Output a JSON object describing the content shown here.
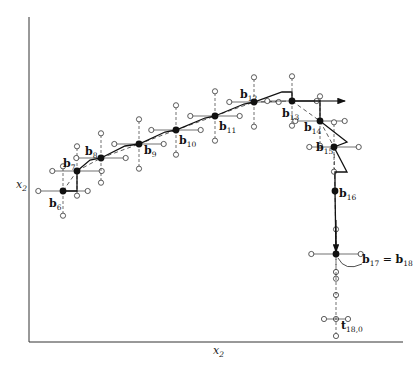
{
  "figure": {
    "axes": {
      "y_label": "x",
      "y_label_sub": "2",
      "x_label": "x",
      "x_label_sub": "2"
    },
    "points": [
      {
        "id": "b6",
        "base": "b",
        "sub": "6"
      },
      {
        "id": "b7",
        "base": "b",
        "sub": "7"
      },
      {
        "id": "b8",
        "base": "b",
        "sub": "8"
      },
      {
        "id": "b9",
        "base": "b",
        "sub": "9"
      },
      {
        "id": "b10",
        "base": "b",
        "sub": "10"
      },
      {
        "id": "b11",
        "base": "b",
        "sub": "11"
      },
      {
        "id": "b12",
        "base": "b",
        "sub": "12"
      },
      {
        "id": "b13",
        "base": "b",
        "sub": "13"
      },
      {
        "id": "b14",
        "base": "b",
        "sub": "14"
      },
      {
        "id": "b15",
        "base": "b",
        "sub": "15"
      },
      {
        "id": "b16",
        "base": "b",
        "sub": "16"
      }
    ],
    "annotation_b17": {
      "left": "b",
      "left_sub": "17",
      "eq": " = ",
      "right": "b",
      "right_sub": "18"
    },
    "annotation_t": {
      "base": "t",
      "sub": "18,0"
    }
  }
}
